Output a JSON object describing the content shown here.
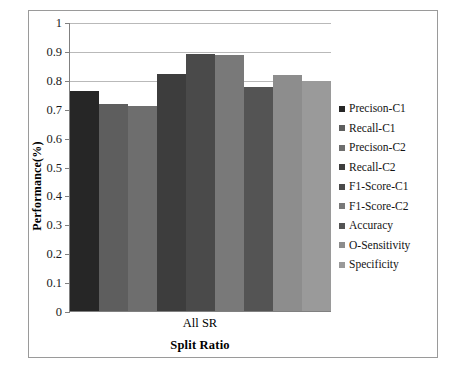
{
  "chart_data": {
    "type": "bar",
    "title": "",
    "xlabel": "Split Ratio",
    "ylabel": "Performance(%)",
    "categories": [
      "All SR"
    ],
    "ylim": [
      0,
      1
    ],
    "ytick_labels": [
      "1",
      "0.9",
      "0.8",
      "0.7",
      "0.6",
      "0.5",
      "0.4",
      "0.3",
      "0.2",
      "0.1",
      "0"
    ],
    "ytick_values": [
      1,
      0.9,
      0.8,
      0.7,
      0.6,
      0.5,
      0.4,
      0.3,
      0.2,
      0.1,
      0
    ],
    "grid": true,
    "legend_position": "right",
    "series": [
      {
        "name": "Precison-C1",
        "values": [
          0.76
        ],
        "color": "#262626"
      },
      {
        "name": "Recall-C1",
        "values": [
          0.715
        ],
        "color": "#5e5e5e"
      },
      {
        "name": "Precison-C2",
        "values": [
          0.71
        ],
        "color": "#6e6e6e"
      },
      {
        "name": "Recall-C2",
        "values": [
          0.82
        ],
        "color": "#3d3d3d"
      },
      {
        "name": "F1-Score-C1",
        "values": [
          0.89
        ],
        "color": "#4a4a4a"
      },
      {
        "name": "F1-Score-C2",
        "values": [
          0.885
        ],
        "color": "#797979"
      },
      {
        "name": "Accuracy",
        "values": [
          0.775
        ],
        "color": "#545454"
      },
      {
        "name": "O-Sensitivity",
        "values": [
          0.815
        ],
        "color": "#8d8d8d"
      },
      {
        "name": "Specificity",
        "values": [
          0.795
        ],
        "color": "#9a9a9a"
      }
    ]
  }
}
